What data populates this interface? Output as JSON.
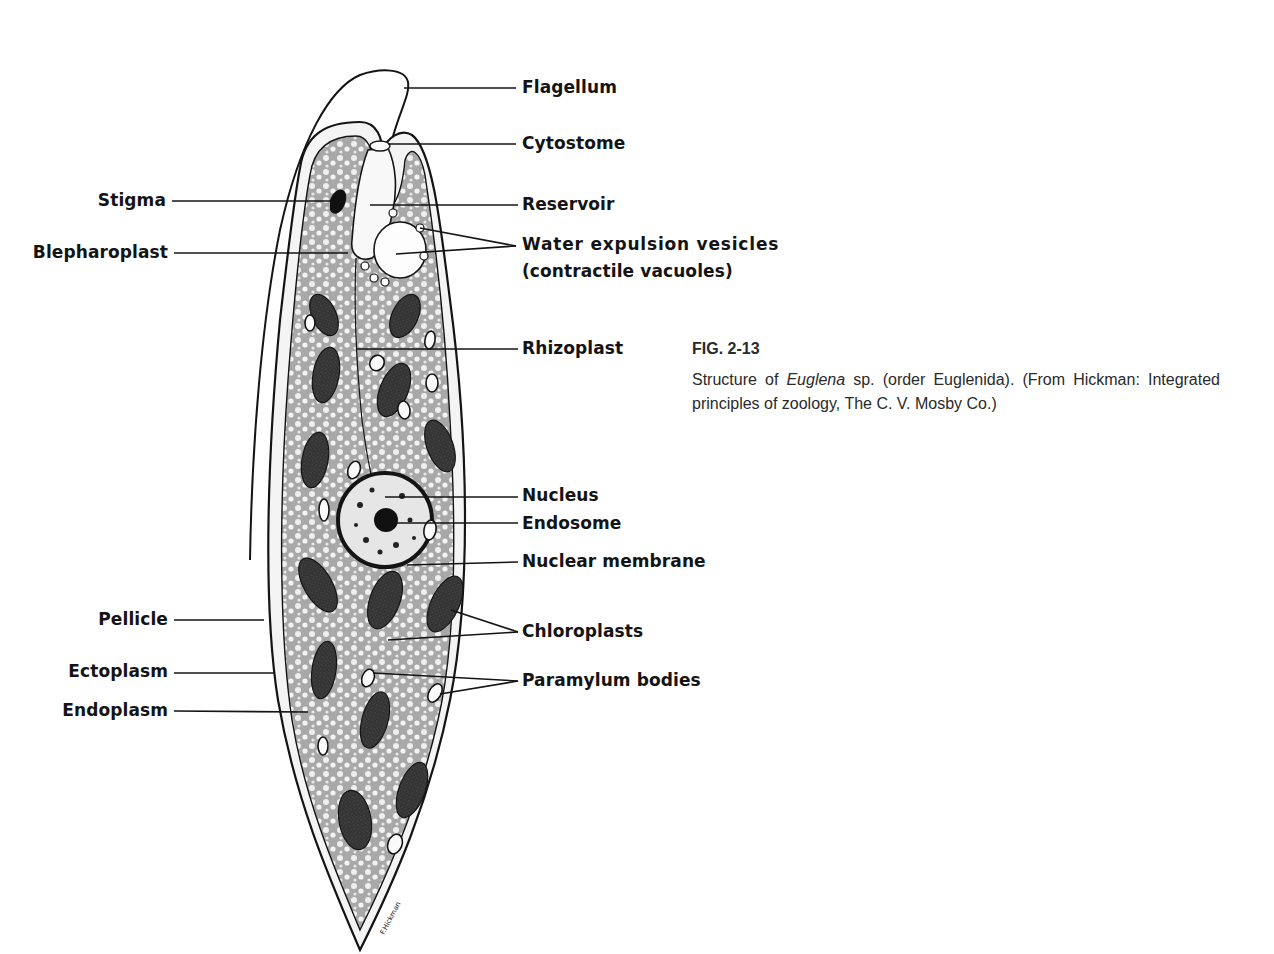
{
  "figure": {
    "id": "FIG. 2-13",
    "caption_before_italic": "Structure of ",
    "caption_italic": "Euglena",
    "caption_after_italic": " sp. (order Euglenida). (From Hickman: Integrated principles of zoology, The C. V. Mosby Co.)",
    "signature": "F.Hickman"
  },
  "labels_right": [
    {
      "key": "flagellum",
      "text": "Flagellum"
    },
    {
      "key": "cytostome",
      "text": "Cytostome"
    },
    {
      "key": "reservoir",
      "text": "Reservoir"
    },
    {
      "key": "water_vesicles",
      "text": "Water expulsion vesicles"
    },
    {
      "key": "water_vesicles_sub",
      "text": "(contractile vacuoles)"
    },
    {
      "key": "rhizoplast",
      "text": "Rhizoplast"
    },
    {
      "key": "nucleus",
      "text": "Nucleus"
    },
    {
      "key": "endosome",
      "text": "Endosome"
    },
    {
      "key": "nuclear_membrane",
      "text": "Nuclear membrane"
    },
    {
      "key": "chloroplasts",
      "text": "Chloroplasts"
    },
    {
      "key": "paramylum",
      "text": "Paramylum bodies"
    }
  ],
  "labels_left": [
    {
      "key": "stigma",
      "text": "Stigma"
    },
    {
      "key": "blepharoplast",
      "text": "Blepharoplast"
    },
    {
      "key": "pellicle",
      "text": "Pellicle"
    },
    {
      "key": "ectoplasm",
      "text": "Ectoplasm"
    },
    {
      "key": "endoplasm",
      "text": "Endoplasm"
    }
  ],
  "colors": {
    "ink": "#141414",
    "cytoplasm": "#9a9a9a",
    "chloroplast": "#3a3a3a",
    "background": "#ffffff"
  }
}
